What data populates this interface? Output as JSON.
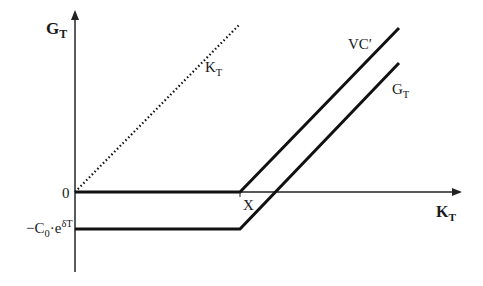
{
  "diagram": {
    "type": "payoff-diagram",
    "axes": {
      "y_label_main": "G",
      "y_label_sub": "T",
      "x_label_main": "K",
      "x_label_sub": "T",
      "origin_label": "0",
      "kink_label": "X",
      "neg_level_label_prefix": "−C",
      "neg_level_label_sub": "0",
      "neg_level_label_mid": "·e",
      "neg_level_label_sup": "δT"
    },
    "curves": [
      {
        "name": "K_T",
        "label_main": "K",
        "label_sub": "T",
        "style": "dotted",
        "description": "45-degree line from origin"
      },
      {
        "name": "VC'",
        "label_main": "VC′",
        "style": "solid",
        "description": "zero until X, then rises with slope 1"
      },
      {
        "name": "G_T",
        "label_main": "G",
        "label_sub": "T",
        "style": "solid",
        "description": "flat at −C0·e^{δT} until X, then rises with slope 1"
      }
    ],
    "colors": {
      "line": "#111111",
      "axis": "#333333",
      "background": "#ffffff"
    }
  }
}
